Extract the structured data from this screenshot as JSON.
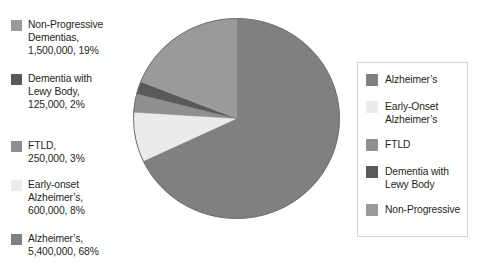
{
  "chart_data": {
    "type": "pie",
    "title": "",
    "xlabel": "",
    "ylabel": "",
    "categories": [
      "Alzheimer's",
      "Early-Onset Alzheimer's",
      "FTLD",
      "Dementia with Lewy Body",
      "Non-Progressive Dementias"
    ],
    "values": [
      68,
      8,
      3,
      2,
      19
    ],
    "counts": [
      5400000,
      600000,
      250000,
      125000,
      1500000
    ],
    "counts_formatted": [
      "5,400,000",
      "600,000",
      "250,000",
      "125,000",
      "1,500,000"
    ],
    "percent_labels": [
      "68%",
      "8%",
      "3%",
      "2%",
      "19%"
    ],
    "colors": [
      "#808080",
      "#ebebeb",
      "#8f8f8f",
      "#595959",
      "#9a9a9a"
    ],
    "start_angle": 0,
    "direction": "clockwise",
    "legend_position": "right",
    "grid": false
  },
  "callouts": {
    "items": [
      {
        "name": "non-progressive-dementias",
        "color": "#9a9a9a",
        "text": "Non-Progressive\nDementias,\n1,500,000, 19%"
      },
      {
        "name": "dementia-with-lewy-body",
        "color": "#595959",
        "text": "Dementia with\nLewy Body,\n125,000, 2%"
      },
      {
        "name": "ftld",
        "color": "#8f8f8f",
        "text": "FTLD,\n250,000, 3%"
      },
      {
        "name": "early-onset-alzheimers",
        "color": "#ebebeb",
        "text": "Early-onset\nAlzheimer’s,\n600,000, 8%"
      },
      {
        "name": "alzheimers",
        "color": "#808080",
        "text": "Alzheimer’s,\n5,400,000, 68%"
      }
    ]
  },
  "legend": {
    "items": [
      {
        "name": "alzheimers",
        "label": "Alzheimer’s",
        "color": "#808080"
      },
      {
        "name": "early-onset-alzheimers",
        "label": "Early-Onset\nAlzheimer’s",
        "color": "#ebebeb"
      },
      {
        "name": "ftld",
        "label": "FTLD",
        "color": "#8f8f8f"
      },
      {
        "name": "dementia-with-lewy-body",
        "label": "Dementia with\nLewy Body",
        "color": "#595959"
      },
      {
        "name": "non-progressive",
        "label": "Non-Progressive",
        "color": "#9a9a9a"
      }
    ]
  },
  "pie": {
    "outline_color": "#6e6e6e",
    "background": "#ffffff"
  }
}
